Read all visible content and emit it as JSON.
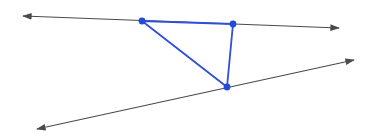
{
  "diagram": {
    "colors": {
      "line": "#4a4a4a",
      "triangle": "#2f4fd6",
      "point": "#2448d8",
      "background": "#ffffff"
    },
    "lines": [
      {
        "name": "upper-line",
        "x1": 23,
        "y1": 16,
        "x2": 339,
        "y2": 28
      },
      {
        "name": "lower-line",
        "x1": 37,
        "y1": 129,
        "x2": 354,
        "y2": 60
      }
    ],
    "points": [
      {
        "name": "point-a",
        "x": 142,
        "y": 21
      },
      {
        "name": "point-b",
        "x": 233,
        "y": 24
      },
      {
        "name": "point-c",
        "x": 227,
        "y": 87
      }
    ]
  }
}
